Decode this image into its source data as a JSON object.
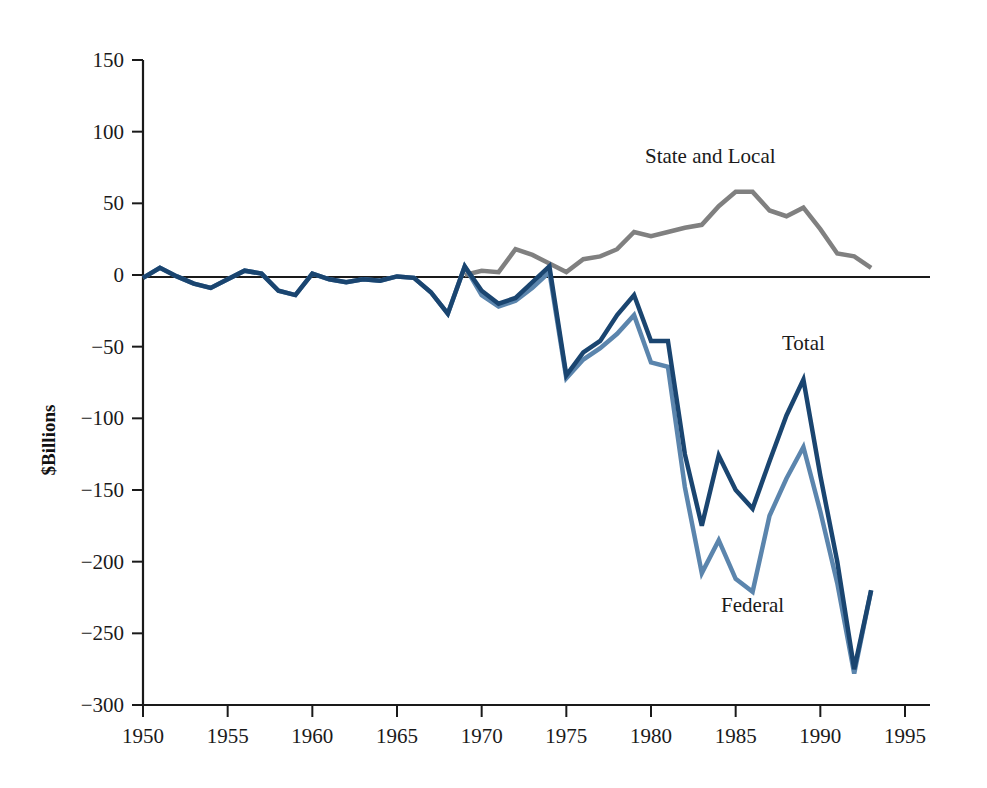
{
  "chart_data": {
    "type": "line",
    "title": "",
    "subtitle": "",
    "xlabel": "",
    "ylabel": "$Billions",
    "xlim": [
      1950,
      1995
    ],
    "ylim": [
      -300,
      150
    ],
    "xticks": [
      1950,
      1955,
      1960,
      1965,
      1970,
      1975,
      1980,
      1985,
      1990,
      1995
    ],
    "yticks": [
      150,
      100,
      50,
      0,
      -50,
      -100,
      -150,
      -200,
      -250,
      -300
    ],
    "xtick_labels": [
      "1950",
      "1955",
      "1960",
      "1965",
      "1970",
      "1975",
      "1980",
      "1985",
      "1990",
      "1995"
    ],
    "ytick_labels": [
      "150",
      "100",
      "50",
      "0",
      "-50",
      "-100",
      "-150",
      "-200",
      "-250",
      "-300"
    ],
    "grid": false,
    "legend_position": "inline-annotations",
    "annotations": [
      {
        "text": "State and Local",
        "x": 1983.5,
        "y": 78,
        "series": "State and Local"
      },
      {
        "text": "Total",
        "x": 1989.0,
        "y": -52,
        "series": "Total"
      },
      {
        "text": "Federal",
        "x": 1986.0,
        "y": -235,
        "series": "Federal"
      }
    ],
    "x": [
      1950,
      1951,
      1952,
      1953,
      1954,
      1955,
      1956,
      1957,
      1958,
      1959,
      1960,
      1961,
      1962,
      1963,
      1964,
      1965,
      1966,
      1967,
      1968,
      1969,
      1970,
      1971,
      1972,
      1973,
      1974,
      1975,
      1976,
      1977,
      1978,
      1979,
      1980,
      1981,
      1982,
      1983,
      1984,
      1985,
      1986,
      1987,
      1988,
      1989,
      1990,
      1991,
      1992,
      1993
    ],
    "series": [
      {
        "name": "Total",
        "color": "#1a4570",
        "values": [
          -2,
          5,
          -1,
          -6,
          -9,
          -3,
          3,
          1,
          -11,
          -14,
          1,
          -3,
          -5,
          -3,
          -4,
          -1,
          -2,
          -12,
          -27,
          6,
          -11,
          -20,
          -16,
          -5,
          6,
          -70,
          -54,
          -46,
          -28,
          -14,
          -46,
          -46,
          -125,
          -175,
          -126,
          -150,
          -163,
          -130,
          -98,
          -73,
          -140,
          -200,
          -275,
          -220
        ]
      },
      {
        "name": "Federal",
        "color": "#5b85ad",
        "values": [
          -2,
          5,
          -1,
          -6,
          -9,
          -3,
          3,
          1,
          -11,
          -14,
          1,
          -3,
          -5,
          -3,
          -4,
          -1,
          -2,
          -12,
          -27,
          6,
          -14,
          -22,
          -18,
          -9,
          2,
          -72,
          -59,
          -51,
          -41,
          -28,
          -61,
          -64,
          -148,
          -208,
          -185,
          -212,
          -221,
          -168,
          -142,
          -120,
          -165,
          -215,
          -278,
          -220
        ]
      },
      {
        "name": "State and Local",
        "color": "#808080",
        "values": [
          null,
          null,
          null,
          null,
          null,
          null,
          null,
          null,
          null,
          null,
          null,
          null,
          null,
          null,
          null,
          null,
          null,
          null,
          null,
          0,
          3,
          2,
          18,
          14,
          8,
          2,
          11,
          13,
          18,
          30,
          27,
          30,
          33,
          35,
          48,
          58,
          58,
          45,
          41,
          47,
          32,
          15,
          13,
          5
        ]
      }
    ]
  },
  "axes": {
    "y_axis_title": "$Billions"
  }
}
